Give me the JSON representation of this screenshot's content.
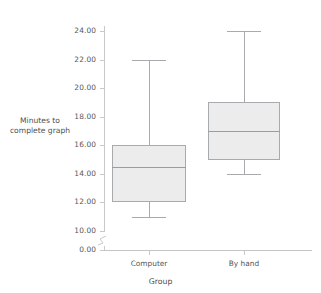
{
  "chart_data": {
    "type": "box",
    "title": "",
    "xlabel": "Group",
    "ylabel": "Minutes to complete graph",
    "ylabel_lines": [
      "Minutes to",
      "complete graph"
    ],
    "categories": [
      "Computer",
      "By hand"
    ],
    "ylim": [
      0,
      25
    ],
    "y_axis_break": true,
    "y_break_between": [
      0,
      10
    ],
    "grid": false,
    "legend": null,
    "y_ticks": [
      {
        "value": 24,
        "label": "24.00"
      },
      {
        "value": 22,
        "label": "22.00"
      },
      {
        "value": 20,
        "label": "20.00"
      },
      {
        "value": 18,
        "label": "18.00"
      },
      {
        "value": 16,
        "label": "16.00"
      },
      {
        "value": 14,
        "label": "14.00"
      },
      {
        "value": 12,
        "label": "12.00"
      },
      {
        "value": 10,
        "label": "10.00"
      },
      {
        "value": 0,
        "label": "0.00"
      }
    ],
    "boxes": [
      {
        "category": "Computer",
        "min": 11.0,
        "q1": 12.0,
        "median": 14.5,
        "q3": 16.0,
        "max": 22.0,
        "outliers": []
      },
      {
        "category": "By hand",
        "min": 14.0,
        "q1": 15.0,
        "median": 17.0,
        "q3": 19.0,
        "max": 24.0,
        "outliers": []
      }
    ],
    "colors": {
      "box_fill": "#ececec",
      "box_border": "#a8abae",
      "median": "#9a9da0",
      "whisker": "#a8abae",
      "axis": "#c7c9cb",
      "text": "#55575a",
      "background": "#ffffff"
    }
  }
}
